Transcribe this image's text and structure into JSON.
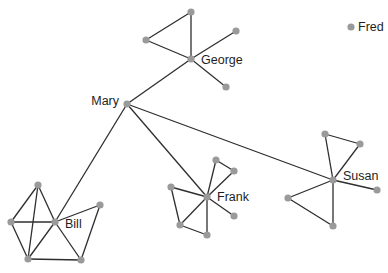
{
  "diagram": {
    "type": "social-network",
    "colors": {
      "edge": "#2e2e2e",
      "node": "#9a9a9a",
      "label": "#1e1e1e"
    },
    "nodes": [
      {
        "id": "george",
        "label": "George",
        "x": 191,
        "y": 59,
        "label_x": 201,
        "label_y": 64,
        "anchor": "start"
      },
      {
        "id": "g_top",
        "label": "",
        "x": 191,
        "y": 12
      },
      {
        "id": "g_left",
        "label": "",
        "x": 146,
        "y": 40
      },
      {
        "id": "g_right_up",
        "label": "",
        "x": 236,
        "y": 31
      },
      {
        "id": "g_right_down",
        "label": "",
        "x": 226,
        "y": 87
      },
      {
        "id": "fred",
        "label": "Fred",
        "x": 351,
        "y": 27,
        "label_x": 358,
        "label_y": 31,
        "anchor": "start"
      },
      {
        "id": "mary",
        "label": "Mary",
        "x": 127,
        "y": 104,
        "label_x": 119,
        "label_y": 105,
        "anchor": "end"
      },
      {
        "id": "bill",
        "label": "Bill",
        "x": 55,
        "y": 222,
        "label_x": 65,
        "label_y": 228,
        "anchor": "start"
      },
      {
        "id": "b_top",
        "label": "",
        "x": 38,
        "y": 185
      },
      {
        "id": "b_left",
        "label": "",
        "x": 11,
        "y": 222
      },
      {
        "id": "b_bottom_left",
        "label": "",
        "x": 28,
        "y": 259
      },
      {
        "id": "b_bottom_right",
        "label": "",
        "x": 81,
        "y": 260
      },
      {
        "id": "b_right",
        "label": "",
        "x": 100,
        "y": 205
      },
      {
        "id": "frank",
        "label": "Frank",
        "x": 207,
        "y": 197,
        "label_x": 217,
        "label_y": 201,
        "anchor": "start"
      },
      {
        "id": "f_top",
        "label": "",
        "x": 216,
        "y": 160
      },
      {
        "id": "f_top_right",
        "label": "",
        "x": 234,
        "y": 171
      },
      {
        "id": "f_left",
        "label": "",
        "x": 171,
        "y": 187
      },
      {
        "id": "f_bottom_left",
        "label": "",
        "x": 180,
        "y": 225
      },
      {
        "id": "f_bottom",
        "label": "",
        "x": 207,
        "y": 235
      },
      {
        "id": "f_right",
        "label": "",
        "x": 234,
        "y": 216
      },
      {
        "id": "susan",
        "label": "Susan",
        "x": 333,
        "y": 180,
        "label_x": 343,
        "label_y": 180,
        "anchor": "start"
      },
      {
        "id": "s_top",
        "label": "",
        "x": 325,
        "y": 134
      },
      {
        "id": "s_top_right",
        "label": "",
        "x": 360,
        "y": 144
      },
      {
        "id": "s_right",
        "label": "",
        "x": 377,
        "y": 190
      },
      {
        "id": "s_left",
        "label": "",
        "x": 288,
        "y": 198
      },
      {
        "id": "s_bottom",
        "label": "",
        "x": 333,
        "y": 226
      }
    ],
    "edges": [
      [
        "george",
        "g_top"
      ],
      [
        "g_top",
        "g_left"
      ],
      [
        "g_left",
        "george"
      ],
      [
        "george",
        "g_right_up"
      ],
      [
        "george",
        "g_right_down"
      ],
      [
        "george",
        "mary"
      ],
      [
        "mary",
        "bill"
      ],
      [
        "mary",
        "frank"
      ],
      [
        "mary",
        "susan"
      ],
      [
        "b_top",
        "b_left"
      ],
      [
        "b_top",
        "bill"
      ],
      [
        "b_top",
        "b_bottom_left"
      ],
      [
        "b_left",
        "bill"
      ],
      [
        "b_left",
        "b_bottom_left"
      ],
      [
        "bill",
        "b_bottom_left"
      ],
      [
        "bill",
        "b_right"
      ],
      [
        "bill",
        "b_bottom_right"
      ],
      [
        "b_bottom_left",
        "b_bottom_right"
      ],
      [
        "b_right",
        "b_bottom_right"
      ],
      [
        "frank",
        "f_top"
      ],
      [
        "f_top",
        "f_top_right"
      ],
      [
        "f_top_right",
        "frank"
      ],
      [
        "frank",
        "f_left"
      ],
      [
        "f_left",
        "f_bottom_left"
      ],
      [
        "f_bottom_left",
        "frank"
      ],
      [
        "f_bottom_left",
        "f_bottom"
      ],
      [
        "f_bottom",
        "frank"
      ],
      [
        "frank",
        "f_right"
      ],
      [
        "susan",
        "s_top"
      ],
      [
        "s_top",
        "s_top_right"
      ],
      [
        "s_top_right",
        "susan"
      ],
      [
        "susan",
        "s_right"
      ],
      [
        "susan",
        "s_left"
      ],
      [
        "s_left",
        "s_bottom"
      ],
      [
        "s_bottom",
        "susan"
      ]
    ]
  }
}
